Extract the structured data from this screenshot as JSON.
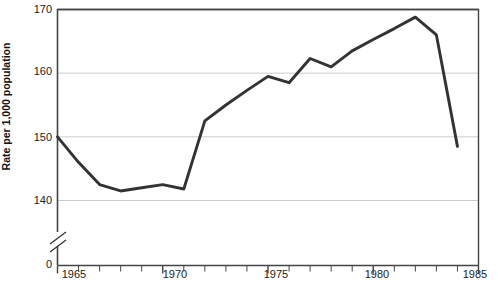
{
  "chart_data": {
    "type": "line",
    "title": "",
    "xlabel": "",
    "ylabel": "Rate per 1,000 population",
    "x": [
      1965,
      1966,
      1967,
      1968,
      1969,
      1970,
      1971,
      1972,
      1973,
      1974,
      1975,
      1976,
      1977,
      1978,
      1979,
      1980,
      1981,
      1982,
      1983,
      1984
    ],
    "values": [
      150,
      146,
      142.5,
      141.5,
      142,
      142.5,
      141.8,
      152.5,
      155,
      157.3,
      159.5,
      158.5,
      162.3,
      161,
      163.5,
      165.3,
      167,
      168.8,
      166,
      148.5
    ],
    "series": [
      {
        "name": "Rate per 1,000 population",
        "values": [
          150,
          146,
          142.5,
          141.5,
          142,
          142.5,
          141.8,
          152.5,
          155,
          157.3,
          159.5,
          158.5,
          162.3,
          161,
          163.5,
          165.3,
          167,
          168.8,
          166,
          148.5
        ]
      }
    ],
    "xlim": [
      1965,
      1985
    ],
    "ylim": [
      140,
      170
    ],
    "y_axis_break": true,
    "y_break_from": 0,
    "y_break_to": 140,
    "ytick_labels": [
      "170",
      "160",
      "150",
      "140",
      "0"
    ],
    "ytick_values": [
      170,
      160,
      150,
      140,
      0
    ],
    "xtick_labels": [
      "1965",
      "1970",
      "1975",
      "1980",
      "1985"
    ],
    "xtick_values": [
      1965,
      1970,
      1975,
      1980,
      1985
    ],
    "xticks_minor_every": 1,
    "grid": "horizontal",
    "legend": "none",
    "line_color": "#333333",
    "grid_color": "#cccccc",
    "axis_color": "#444444"
  }
}
